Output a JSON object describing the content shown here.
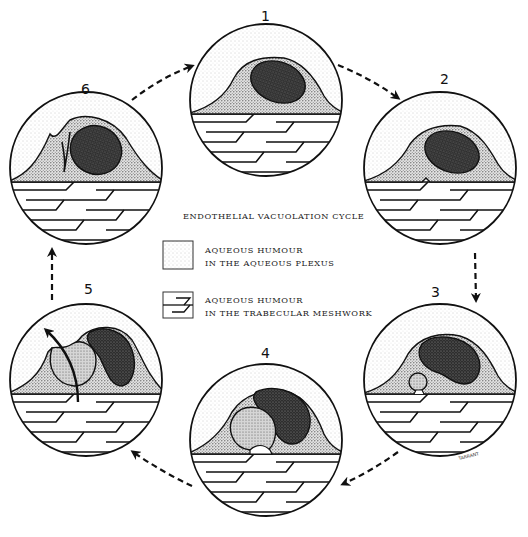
{
  "diagram": {
    "title": "ENDOTHELIAL VACUOLATION CYCLE",
    "legend": [
      {
        "key": "aqueous-plexus",
        "line1": "AQUEOUS HUMOUR",
        "line2": "IN THE AQUEOUS PLEXUS",
        "swatch": "stippled"
      },
      {
        "key": "trabecular-meshwork",
        "line1": "AQUEOUS HUMOUR",
        "line2": "IN THE TRABECULAR MESHWORK",
        "swatch": "hatched-lines"
      }
    ],
    "stages": [
      {
        "id": "1",
        "label": "1",
        "description": "Endothelial cell with nucleus, no vacuole"
      },
      {
        "id": "2",
        "label": "2",
        "description": "Small invagination forms at basal surface"
      },
      {
        "id": "3",
        "label": "3",
        "description": "Small vacuole forming from basal side"
      },
      {
        "id": "4",
        "label": "4",
        "description": "Large giant vacuole open to trabecular meshwork"
      },
      {
        "id": "5",
        "label": "5",
        "description": "Vacuole opens apically; arrow shows transcellular flow"
      },
      {
        "id": "6",
        "label": "6",
        "description": "Vacuole collapsed; cell returning to resting state"
      }
    ],
    "flow_direction": "clockwise",
    "arrows": [
      {
        "from": "6",
        "to": "1",
        "style": "dashed"
      },
      {
        "from": "1",
        "to": "2",
        "style": "dashed"
      },
      {
        "from": "2",
        "to": "3",
        "style": "dashed"
      },
      {
        "from": "3",
        "to": "4",
        "style": "dashed"
      },
      {
        "from": "4",
        "to": "5",
        "style": "dashed"
      },
      {
        "from": "5",
        "to": "6",
        "style": "dashed"
      }
    ],
    "signature": "TARRANT",
    "colors": {
      "ink": "#111111",
      "stipple_light": "#f2f2f2",
      "cytoplasm": "#bdbdbd",
      "nucleus": "#3a3a3a",
      "vacuole": "#a8a8a8",
      "background": "#ffffff"
    }
  }
}
